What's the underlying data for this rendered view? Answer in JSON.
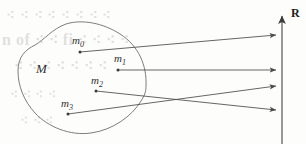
{
  "figure": {
    "name": "set-to-real-line-mapping-diagram",
    "background_color": "#fdfdfc",
    "ink_color": "#4a4a48",
    "axis_color": "#6b6b68"
  },
  "set": {
    "label": "M",
    "shape": "irregular-closed-blob"
  },
  "points": [
    {
      "id": "m0",
      "label": "m",
      "subscript": "0",
      "label_x": 72,
      "label_y": 44,
      "dot_x": 80,
      "dot_y": 52
    },
    {
      "id": "m1",
      "label": "m",
      "subscript": "1",
      "label_x": 114,
      "label_y": 62,
      "dot_x": 118,
      "dot_y": 70
    },
    {
      "id": "m2",
      "label": "m",
      "subscript": "2",
      "label_x": 91,
      "label_y": 84,
      "dot_x": 96,
      "dot_y": 91
    },
    {
      "id": "m3",
      "label": "m",
      "subscript": "3",
      "label_x": 61,
      "label_y": 107,
      "dot_x": 68,
      "dot_y": 114
    }
  ],
  "arrows": [
    {
      "id": "arrow-m0",
      "from_x": 80,
      "from_y": 52,
      "to_x": 279,
      "to_y": 35
    },
    {
      "id": "arrow-m1",
      "from_x": 118,
      "from_y": 70,
      "to_x": 279,
      "to_y": 70
    },
    {
      "id": "arrow-m2",
      "from_x": 96,
      "from_y": 91,
      "to_x": 279,
      "to_y": 110
    },
    {
      "id": "arrow-m3",
      "from_x": 68,
      "from_y": 114,
      "to_x": 279,
      "to_y": 86
    }
  ],
  "axis": {
    "label": "R",
    "x": 282,
    "top_y": 12,
    "bottom_y": 144,
    "arrow_direction": "up"
  },
  "bleed_text": {
    "line1": "⁖ ⁖ ⁖ ⁖ ⁖ ⁖ ⁖ ⁖",
    "line2": "n of ⁖ ⁖ fi ⁖ ⁖ ⁖ ⁖",
    "line3": "⁖ ⁖ ⁖ ⁖ ⁖ ⁖ ⁖",
    "line4": "⁖ ⁖ ⁖ ⁖",
    "line5": "⁖ ⁖ ⁖"
  }
}
